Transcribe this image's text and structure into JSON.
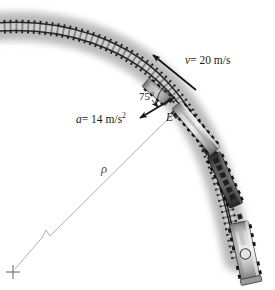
{
  "figure": {
    "kind": "train-on-curved-track-kinematics-diagram",
    "labels": {
      "velocity": "v = 20 m/s",
      "velocity_symbol": "v",
      "velocity_value": "= 20 m/s",
      "acceleration": "a = 14 m/s2",
      "acceleration_symbol": "a",
      "acceleration_value": "= 14 m/s",
      "acceleration_exponent": "2",
      "angle": "75°",
      "point": "E",
      "radius": "ρ"
    },
    "colors": {
      "rail_dark": "#1c1c1c",
      "tie_dark": "#242424",
      "ballast_gray": "#c9c9c9",
      "car_light": "#bdbdbd",
      "car_dark": "#4a4a4a",
      "radius_line": "#9a9a9a",
      "arrow": "#141414",
      "background": "#ffffff"
    },
    "geometry": {
      "center_of_curvature": [
        13,
        272
      ],
      "point_E": [
        176,
        110
      ],
      "velocity_arrow_from": [
        193,
        88
      ],
      "velocity_arrow_to": [
        150,
        53
      ],
      "acceleration_arrow_from": [
        174,
        96
      ],
      "acceleration_arrow_to": [
        140,
        117
      ],
      "break_mark": [
        45,
        233
      ]
    }
  }
}
